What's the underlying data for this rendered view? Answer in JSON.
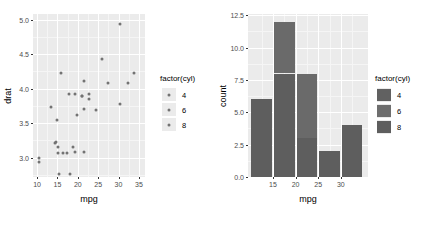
{
  "chart_data": [
    {
      "type": "scatter",
      "title": "",
      "xlabel": "mpg",
      "ylabel": "drat",
      "xlim": [
        9.0,
        36.5
      ],
      "ylim": [
        2.72,
        5.08
      ],
      "xticks": [
        "10",
        "15",
        "20",
        "25",
        "30",
        "35"
      ],
      "xtickvals": [
        10,
        15,
        20,
        25,
        30,
        35
      ],
      "yticks": [
        "3.0",
        "3.5",
        "4.0",
        "4.5",
        "5.0"
      ],
      "ytickvals": [
        3.0,
        3.5,
        4.0,
        4.5,
        5.0
      ],
      "grid": true,
      "legend": {
        "title": "factor(cyl)",
        "position": "right",
        "entries": [
          {
            "label": "4",
            "color": "#737373"
          },
          {
            "label": "6",
            "color": "#737373"
          },
          {
            "label": "8",
            "color": "#737373"
          }
        ]
      },
      "point_color": "#737373",
      "points": [
        {
          "x": 21.0,
          "y": 3.9,
          "cyl": "6"
        },
        {
          "x": 21.0,
          "y": 3.9,
          "cyl": "6"
        },
        {
          "x": 22.8,
          "y": 3.85,
          "cyl": "4"
        },
        {
          "x": 21.4,
          "y": 3.08,
          "cyl": "6"
        },
        {
          "x": 18.7,
          "y": 3.15,
          "cyl": "8"
        },
        {
          "x": 18.1,
          "y": 2.76,
          "cyl": "6"
        },
        {
          "x": 14.3,
          "y": 3.21,
          "cyl": "8"
        },
        {
          "x": 24.4,
          "y": 3.69,
          "cyl": "4"
        },
        {
          "x": 22.8,
          "y": 3.92,
          "cyl": "4"
        },
        {
          "x": 19.2,
          "y": 3.92,
          "cyl": "6"
        },
        {
          "x": 17.8,
          "y": 3.92,
          "cyl": "6"
        },
        {
          "x": 16.4,
          "y": 3.07,
          "cyl": "8"
        },
        {
          "x": 17.3,
          "y": 3.07,
          "cyl": "8"
        },
        {
          "x": 15.2,
          "y": 3.07,
          "cyl": "8"
        },
        {
          "x": 10.4,
          "y": 2.93,
          "cyl": "8"
        },
        {
          "x": 10.4,
          "y": 3.0,
          "cyl": "8"
        },
        {
          "x": 14.7,
          "y": 3.23,
          "cyl": "8"
        },
        {
          "x": 32.4,
          "y": 4.08,
          "cyl": "4"
        },
        {
          "x": 30.4,
          "y": 4.93,
          "cyl": "4"
        },
        {
          "x": 33.9,
          "y": 4.22,
          "cyl": "4"
        },
        {
          "x": 21.5,
          "y": 3.7,
          "cyl": "4"
        },
        {
          "x": 15.5,
          "y": 2.76,
          "cyl": "8"
        },
        {
          "x": 15.2,
          "y": 3.15,
          "cyl": "8"
        },
        {
          "x": 13.3,
          "y": 3.73,
          "cyl": "8"
        },
        {
          "x": 19.2,
          "y": 3.08,
          "cyl": "8"
        },
        {
          "x": 27.3,
          "y": 4.08,
          "cyl": "4"
        },
        {
          "x": 26.0,
          "y": 4.43,
          "cyl": "4"
        },
        {
          "x": 30.4,
          "y": 3.77,
          "cyl": "4"
        },
        {
          "x": 15.8,
          "y": 4.22,
          "cyl": "8"
        },
        {
          "x": 19.7,
          "y": 3.62,
          "cyl": "6"
        },
        {
          "x": 15.0,
          "y": 3.54,
          "cyl": "8"
        },
        {
          "x": 21.4,
          "y": 4.11,
          "cyl": "4"
        }
      ]
    },
    {
      "type": "bar",
      "subtype": "stacked-histogram",
      "title": "",
      "xlabel": "mpg",
      "ylabel": "count",
      "xlim": [
        9.5,
        36.0
      ],
      "ylim": [
        0.0,
        12.6
      ],
      "xticks": [
        "15",
        "20",
        "25",
        "30"
      ],
      "xtickvals": [
        15,
        20,
        25,
        30
      ],
      "yticks": [
        "0.0",
        "2.5",
        "5.0",
        "7.5",
        "10.0",
        "12.5"
      ],
      "ytickvals": [
        0.0,
        2.5,
        5.0,
        7.5,
        10.0,
        12.5
      ],
      "grid": true,
      "legend": {
        "title": "factor(cyl)",
        "position": "right",
        "entries": [
          {
            "label": "4",
            "color": "#616161"
          },
          {
            "label": "6",
            "color": "#6e6e6e"
          },
          {
            "label": "8",
            "color": "#5e5e5e"
          }
        ]
      },
      "bins": [
        {
          "x0": 10.0,
          "x1": 15.0,
          "total": 6,
          "segments": [
            {
              "cyl": "8",
              "value": 6,
              "color": "#5e5e5e"
            }
          ]
        },
        {
          "x0": 15.0,
          "x1": 20.0,
          "total": 12,
          "segments": [
            {
              "cyl": "8",
              "value": 8,
              "color": "#5e5e5e"
            },
            {
              "cyl": "6",
              "value": 4,
              "color": "#6a6a6a"
            }
          ]
        },
        {
          "x0": 20.0,
          "x1": 25.0,
          "total": 8,
          "segments": [
            {
              "cyl": "8",
              "value": 3,
              "color": "#5e5e5e"
            },
            {
              "cyl": "4",
              "value": 5,
              "color": "#6a6a6a"
            }
          ]
        },
        {
          "x0": 25.0,
          "x1": 30.0,
          "total": 2,
          "segments": [
            {
              "cyl": "4",
              "value": 2,
              "color": "#5e5e5e"
            }
          ]
        },
        {
          "x0": 30.0,
          "x1": 35.0,
          "total": 4,
          "segments": [
            {
              "cyl": "4",
              "value": 4,
              "color": "#5e5e5e"
            }
          ]
        }
      ]
    }
  ]
}
